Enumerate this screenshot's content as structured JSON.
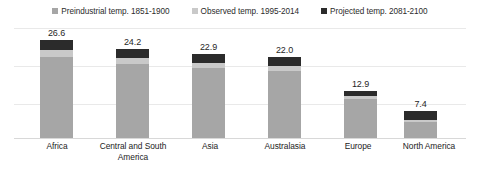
{
  "chart_data": {
    "type": "bar",
    "subtype": "stacked-column",
    "title": "",
    "xlabel": "",
    "ylabel": "",
    "ylim": [
      0,
      30
    ],
    "grid": true,
    "gridlines": [
      10,
      20,
      30
    ],
    "legend_position": "top-center",
    "categories": [
      "Africa",
      "Central and South America",
      "Asia",
      "Australasia",
      "Europe",
      "North America"
    ],
    "totals": [
      26.6,
      24.2,
      22.9,
      22.0,
      12.9,
      7.4
    ],
    "total_labels": [
      "26.6",
      "24.2",
      "22.9",
      "22.0",
      "12.9",
      "7.4"
    ],
    "series": [
      {
        "name": "Preindustrial temp. 1851-1900",
        "color": "#a6a6a6",
        "values": [
          22.1,
          20.1,
          19.0,
          18.3,
          10.7,
          4.3
        ]
      },
      {
        "name": "Observed temp. 1995-2014",
        "color": "#c9c9c9",
        "values": [
          1.8,
          1.6,
          1.5,
          1.4,
          0.8,
          0.5
        ]
      },
      {
        "name": "Projected temp. 2081-2100",
        "color": "#2b2b2b",
        "values": [
          2.7,
          2.5,
          2.4,
          2.3,
          1.4,
          2.6
        ]
      }
    ]
  },
  "legend": {
    "items": [
      {
        "label": "Preindustrial temp. 1851-1900",
        "color": "#a6a6a6"
      },
      {
        "label": "Observed temp. 1995-2014",
        "color": "#c9c9c9"
      },
      {
        "label": "Projected temp. 2081-2100",
        "color": "#2b2b2b"
      }
    ]
  },
  "axis": {
    "max": 30
  }
}
